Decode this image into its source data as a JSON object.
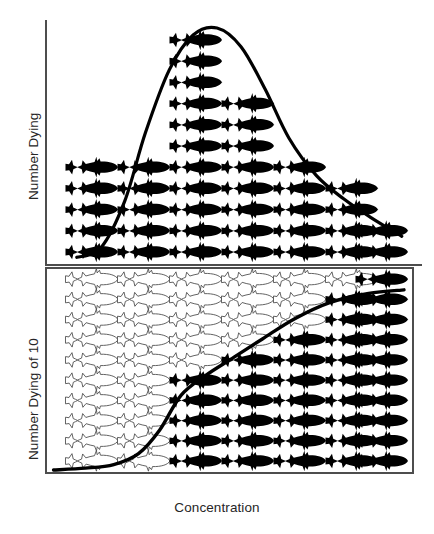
{
  "figure": {
    "title": "",
    "background": "#ffffff",
    "ink": "#000000",
    "outline": "#4d4d4d"
  },
  "labels": {
    "y_top": "Number Dying",
    "y_bottom": "Number Dying of 10",
    "x": "Concentration"
  },
  "chart_data": [
    {
      "type": "bar",
      "panel": "top",
      "title": "",
      "xlabel": "Concentration",
      "ylabel": "Number Dying",
      "categories": [
        "c1",
        "c2",
        "c3",
        "c4",
        "c5",
        "c6",
        "c7"
      ],
      "values": [
        5,
        5,
        11,
        8,
        5,
        4,
        2
      ],
      "ylim": [
        0,
        11
      ],
      "grid": false,
      "legend": "none",
      "glyph": "fish-silhouette",
      "glyph_fill": "#000000",
      "annotations": [
        {
          "name": "normal-distribution-curve",
          "type": "line",
          "description": "bell-shaped frequency-of-death curve overlaid on fish pictogram columns",
          "x": [
            0.02,
            0.09,
            0.16,
            0.22,
            0.29,
            0.36,
            0.43,
            0.5,
            0.57,
            0.64,
            0.72,
            0.8,
            0.88,
            0.97
          ],
          "y": [
            0.02,
            0.06,
            0.26,
            0.55,
            0.82,
            0.97,
            1.0,
            0.92,
            0.74,
            0.53,
            0.37,
            0.27,
            0.19,
            0.11
          ]
        }
      ]
    },
    {
      "type": "bar",
      "panel": "bottom",
      "title": "",
      "xlabel": "Concentration",
      "ylabel": "Number Dying of 10",
      "categories": [
        "c1",
        "c2",
        "c3",
        "c4",
        "c5",
        "c6",
        "c7"
      ],
      "values": [
        0,
        0,
        5,
        6,
        7,
        9,
        10
      ],
      "total_per_column": 10,
      "ylim": [
        0,
        10
      ],
      "grid": false,
      "legend": "none",
      "glyph": "fish-silhouette",
      "glyph_fill_dead": "#000000",
      "glyph_fill_alive": "#ffffff",
      "glyph_stroke_alive": "#4d4d4d",
      "annotations": [
        {
          "name": "cumulative-sigmoid-curve",
          "type": "line",
          "description": "cumulative dose-response sigmoid rising from 0 to 10 of 10",
          "x": [
            0.01,
            0.1,
            0.18,
            0.25,
            0.31,
            0.37,
            0.44,
            0.52,
            0.6,
            0.69,
            0.79,
            0.9,
            1.0
          ],
          "y": [
            0.0,
            0.01,
            0.03,
            0.09,
            0.22,
            0.41,
            0.52,
            0.62,
            0.72,
            0.83,
            0.92,
            0.97,
            0.99
          ]
        }
      ]
    }
  ],
  "panels": {
    "top": {
      "name": "frequency-panel",
      "axes": [
        "left",
        "bottom"
      ]
    },
    "bottom": {
      "name": "cumulative-panel",
      "axes": [
        "left",
        "bottom",
        "top",
        "right"
      ]
    }
  }
}
